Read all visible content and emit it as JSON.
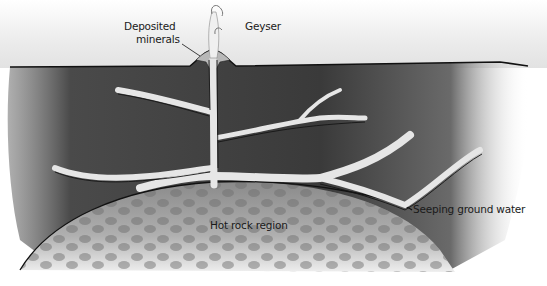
{
  "diagram": {
    "labels": {
      "deposited_minerals_line1": "Deposited",
      "deposited_minerals_line2": "minerals",
      "geyser": "Geyser",
      "hot_rock_region": "Hot rock region",
      "seeping_ground_water": "Seeping ground water"
    },
    "colors": {
      "sky": "#eeeeee",
      "rock_dark": "#3a3a3a",
      "rock_mid": "#6a6a6a",
      "water_channel": "#e4e4e4",
      "hot_rock": "#9a9a9a",
      "hot_rock_cells": "#7a7a7a",
      "mineral_mound": "#b5b5b5",
      "outline": "#111111"
    }
  }
}
